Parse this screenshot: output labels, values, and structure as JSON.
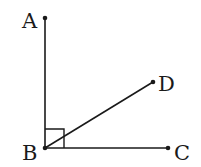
{
  "diagram": {
    "type": "geometry",
    "points": [
      {
        "id": "A",
        "label": "A",
        "x": 45,
        "y": 18
      },
      {
        "id": "B",
        "label": "B",
        "x": 45,
        "y": 148
      },
      {
        "id": "C",
        "label": "C",
        "x": 168,
        "y": 148
      },
      {
        "id": "D",
        "label": "D",
        "x": 153,
        "y": 82
      }
    ],
    "segments": [
      {
        "from": "B",
        "to": "A"
      },
      {
        "from": "B",
        "to": "C"
      },
      {
        "from": "B",
        "to": "D"
      }
    ],
    "right_angle_marker": {
      "vertex": "B",
      "between": [
        "A",
        "C"
      ]
    },
    "colors": {
      "stroke": "#1a1a1a",
      "background": "#ffffff"
    }
  }
}
